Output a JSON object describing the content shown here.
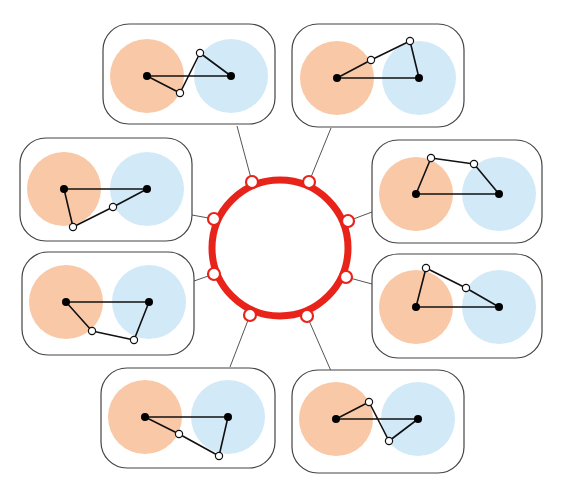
{
  "colors": {
    "ring": "#e8231a",
    "orange_region": "#f9c8a6",
    "blue_region": "#d2e9f8",
    "panel_border": "#444444",
    "connector": "#555555",
    "edge": "#111111",
    "filled_node": "#000000",
    "open_node_fill": "#ffffff"
  },
  "ring": {
    "cx": 280,
    "cy": 248,
    "r": 68,
    "stroke_width": 7,
    "nodes": [
      {
        "x": 252,
        "y": 182
      },
      {
        "x": 309,
        "y": 182
      },
      {
        "x": 214,
        "y": 219
      },
      {
        "x": 348,
        "y": 221
      },
      {
        "x": 214,
        "y": 274
      },
      {
        "x": 346,
        "y": 277
      },
      {
        "x": 250,
        "y": 315
      },
      {
        "x": 307,
        "y": 316
      }
    ]
  },
  "panels": [
    {
      "id": "top-left",
      "x": 103,
      "y": 24,
      "w": 172,
      "h": 100,
      "orange": {
        "cx": 147,
        "cy": 76,
        "r": 37
      },
      "blue": {
        "cx": 231,
        "cy": 76,
        "r": 37
      },
      "left_node": {
        "x": 147,
        "y": 76
      },
      "right_node": {
        "x": 231,
        "y": 76
      },
      "open_nodes": [
        {
          "x": 180,
          "y": 93
        },
        {
          "x": 200,
          "y": 53
        }
      ],
      "path": [
        [
          147,
          76
        ],
        [
          180,
          93
        ],
        [
          200,
          53
        ],
        [
          231,
          76
        ],
        [
          147,
          76
        ]
      ],
      "connector": {
        "from": [
          237,
          126
        ],
        "to": [
          252,
          182
        ]
      }
    },
    {
      "id": "top-right",
      "x": 292,
      "y": 24,
      "w": 172,
      "h": 103,
      "orange": {
        "cx": 337,
        "cy": 78,
        "r": 37
      },
      "blue": {
        "cx": 419,
        "cy": 78,
        "r": 37
      },
      "left_node": {
        "x": 337,
        "y": 78
      },
      "right_node": {
        "x": 419,
        "y": 78
      },
      "open_nodes": [
        {
          "x": 371,
          "y": 60
        },
        {
          "x": 410,
          "y": 41
        }
      ],
      "path": [
        [
          337,
          78
        ],
        [
          371,
          60
        ],
        [
          410,
          41
        ],
        [
          419,
          78
        ],
        [
          337,
          78
        ]
      ],
      "connector": {
        "from": [
          331,
          128
        ],
        "to": [
          309,
          182
        ]
      }
    },
    {
      "id": "middle-left-upper",
      "x": 20,
      "y": 138,
      "w": 172,
      "h": 103,
      "orange": {
        "cx": 64,
        "cy": 189,
        "r": 37
      },
      "blue": {
        "cx": 147,
        "cy": 189,
        "r": 37
      },
      "left_node": {
        "x": 64,
        "y": 189
      },
      "right_node": {
        "x": 147,
        "y": 189
      },
      "open_nodes": [
        {
          "x": 73,
          "y": 227
        },
        {
          "x": 113,
          "y": 207
        }
      ],
      "path": [
        [
          64,
          189
        ],
        [
          73,
          227
        ],
        [
          113,
          207
        ],
        [
          147,
          189
        ],
        [
          64,
          189
        ]
      ],
      "connector": {
        "from": [
          192,
          215
        ],
        "to": [
          214,
          219
        ]
      }
    },
    {
      "id": "middle-right-upper",
      "x": 372,
      "y": 140,
      "w": 170,
      "h": 103,
      "orange": {
        "cx": 416,
        "cy": 194,
        "r": 37
      },
      "blue": {
        "cx": 499,
        "cy": 194,
        "r": 37
      },
      "left_node": {
        "x": 416,
        "y": 194
      },
      "right_node": {
        "x": 499,
        "y": 194
      },
      "open_nodes": [
        {
          "x": 431,
          "y": 158
        },
        {
          "x": 474,
          "y": 164
        }
      ],
      "path": [
        [
          416,
          194
        ],
        [
          431,
          158
        ],
        [
          474,
          164
        ],
        [
          499,
          194
        ],
        [
          416,
          194
        ]
      ],
      "connector": {
        "from": [
          372,
          212
        ],
        "to": [
          348,
          221
        ]
      }
    },
    {
      "id": "middle-left-lower",
      "x": 22,
      "y": 252,
      "w": 172,
      "h": 103,
      "orange": {
        "cx": 66,
        "cy": 302,
        "r": 37
      },
      "blue": {
        "cx": 149,
        "cy": 302,
        "r": 37
      },
      "left_node": {
        "x": 66,
        "y": 302
      },
      "right_node": {
        "x": 149,
        "y": 302
      },
      "open_nodes": [
        {
          "x": 92,
          "y": 331
        },
        {
          "x": 134,
          "y": 340
        }
      ],
      "path": [
        [
          66,
          302
        ],
        [
          92,
          331
        ],
        [
          134,
          340
        ],
        [
          149,
          302
        ],
        [
          66,
          302
        ]
      ],
      "connector": {
        "from": [
          194,
          281
        ],
        "to": [
          214,
          274
        ]
      }
    },
    {
      "id": "middle-right-lower",
      "x": 372,
      "y": 254,
      "w": 170,
      "h": 104,
      "orange": {
        "cx": 416,
        "cy": 307,
        "r": 37
      },
      "blue": {
        "cx": 499,
        "cy": 307,
        "r": 37
      },
      "left_node": {
        "x": 416,
        "y": 307
      },
      "right_node": {
        "x": 499,
        "y": 307
      },
      "open_nodes": [
        {
          "x": 426,
          "y": 268
        },
        {
          "x": 466,
          "y": 288
        }
      ],
      "path": [
        [
          416,
          307
        ],
        [
          426,
          268
        ],
        [
          466,
          288
        ],
        [
          499,
          307
        ],
        [
          416,
          307
        ]
      ],
      "connector": {
        "from": [
          372,
          284
        ],
        "to": [
          346,
          277
        ]
      }
    },
    {
      "id": "bottom-left",
      "x": 101,
      "y": 368,
      "w": 174,
      "h": 100,
      "orange": {
        "cx": 145,
        "cy": 417,
        "r": 37
      },
      "blue": {
        "cx": 228,
        "cy": 417,
        "r": 37
      },
      "left_node": {
        "x": 145,
        "y": 417
      },
      "right_node": {
        "x": 228,
        "y": 417
      },
      "open_nodes": [
        {
          "x": 179,
          "y": 434
        },
        {
          "x": 219,
          "y": 456
        }
      ],
      "path": [
        [
          145,
          417
        ],
        [
          179,
          434
        ],
        [
          219,
          456
        ],
        [
          228,
          417
        ],
        [
          145,
          417
        ]
      ],
      "connector": {
        "from": [
          230,
          367
        ],
        "to": [
          250,
          315
        ]
      }
    },
    {
      "id": "bottom-right",
      "x": 292,
      "y": 370,
      "w": 172,
      "h": 103,
      "orange": {
        "cx": 336,
        "cy": 419,
        "r": 37
      },
      "blue": {
        "cx": 418,
        "cy": 419,
        "r": 37
      },
      "left_node": {
        "x": 336,
        "y": 419
      },
      "right_node": {
        "x": 418,
        "y": 419
      },
      "open_nodes": [
        {
          "x": 369,
          "y": 402
        },
        {
          "x": 389,
          "y": 441
        }
      ],
      "path": [
        [
          336,
          419
        ],
        [
          369,
          402
        ],
        [
          389,
          441
        ],
        [
          418,
          419
        ],
        [
          336,
          419
        ]
      ],
      "connector": {
        "from": [
          331,
          371
        ],
        "to": [
          307,
          316
        ]
      }
    }
  ]
}
